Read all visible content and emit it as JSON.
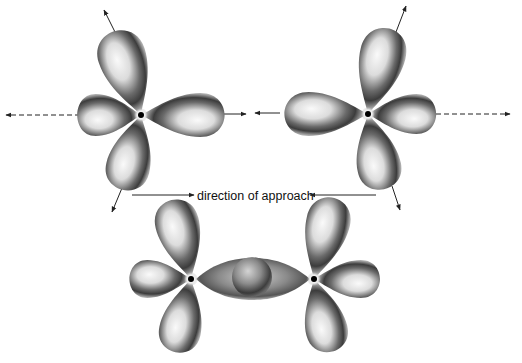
{
  "diagram": {
    "type": "orbital-overlap",
    "caption": "direction of approach",
    "colors": {
      "background": "#ffffff",
      "lobe_light": "#f2f2f2",
      "lobe_mid": "#b8b8b8",
      "lobe_dark": "#3a3a3a",
      "nucleus": "#000000",
      "arrow": "#222222"
    },
    "atoms": [
      {
        "id": "top-left-atom",
        "x": 141,
        "y": 115
      },
      {
        "id": "top-right-atom",
        "x": 368,
        "y": 114
      },
      {
        "id": "bottom-left-atom",
        "x": 191,
        "y": 279
      },
      {
        "id": "bottom-right-atom",
        "x": 314,
        "y": 279
      }
    ],
    "arrows": [
      {
        "id": "axis-arrow-left",
        "style": "dashed"
      },
      {
        "id": "axis-arrow-right",
        "style": "dashed"
      },
      {
        "id": "approach-arrow-left",
        "style": "solid"
      },
      {
        "id": "approach-arrow-right",
        "style": "solid"
      }
    ]
  }
}
